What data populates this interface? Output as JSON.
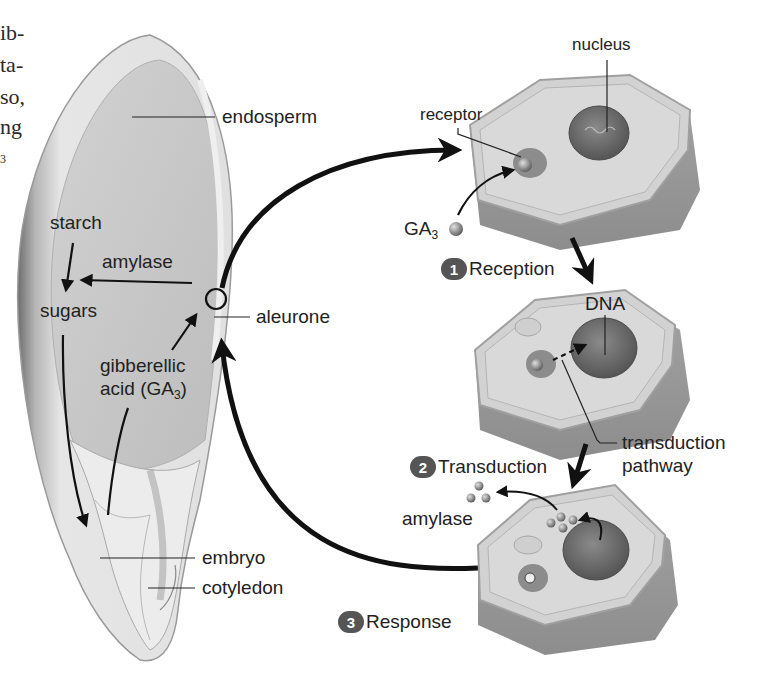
{
  "figure": {
    "cropped_margin_text": [
      "ib-",
      "ta-",
      "so,",
      "ng",
      "3"
    ],
    "seed_labels": {
      "endosperm": "endosperm",
      "starch": "starch",
      "amylase": "amylase",
      "sugars": "sugars",
      "aleurone": "aleurone",
      "gibberellic": "gibberellic",
      "acid_prefix": "acid (GA",
      "acid_sub": "3",
      "acid_suffix": ")",
      "embryo": "embryo",
      "cotyledon": "cotyledon"
    },
    "cell_labels": {
      "nucleus": "nucleus",
      "receptor": "receptor",
      "ga3_prefix": "GA",
      "ga3_sub": "3",
      "dna": "DNA",
      "transduction_pathway_line1": "transduction",
      "transduction_pathway_line2": "pathway",
      "amylase": "amylase"
    },
    "steps": [
      {
        "number": "1",
        "label": "Reception"
      },
      {
        "number": "2",
        "label": "Transduction"
      },
      {
        "number": "3",
        "label": "Response"
      }
    ],
    "colors": {
      "seed_coat": "#d6d6d6",
      "seed_dark_edge": "#8a8a8a",
      "endosperm": "#c9c9c9",
      "embryo": "#ebebeb",
      "cell_top": "#cfcfcf",
      "cell_wall": "#a9a9a9",
      "cell_side": "#9c9c9c",
      "nucleus": "#6d6d6d",
      "arrow": "#111111",
      "step_badge": "#555555"
    }
  }
}
